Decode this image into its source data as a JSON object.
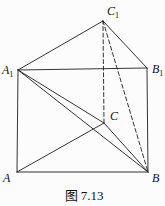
{
  "figure": {
    "caption": "图 7.13",
    "colors": {
      "line": "#1e1e1e",
      "background": "#fcfcfc",
      "text": "#111111"
    },
    "vertices": {
      "A": [
        17,
        172
      ],
      "B": [
        148,
        172
      ],
      "C": [
        104,
        123
      ],
      "A1": [
        18,
        70
      ],
      "B1": [
        147,
        68
      ],
      "C1": [
        103,
        21
      ]
    },
    "edges": [
      {
        "from": "A",
        "to": "B",
        "dashed": false
      },
      {
        "from": "A",
        "to": "A1",
        "dashed": false
      },
      {
        "from": "B",
        "to": "B1",
        "dashed": false
      },
      {
        "from": "A1",
        "to": "B1",
        "dashed": false
      },
      {
        "from": "A1",
        "to": "C1",
        "dashed": false
      },
      {
        "from": "C1",
        "to": "B1",
        "dashed": false
      },
      {
        "from": "A",
        "to": "C",
        "dashed": false
      },
      {
        "from": "C",
        "to": "B",
        "dashed": false
      },
      {
        "from": "A1",
        "to": "C",
        "dashed": false
      },
      {
        "from": "A1",
        "to": "B",
        "dashed": false
      },
      {
        "from": "C",
        "to": "C1",
        "dashed": true
      },
      {
        "from": "C1",
        "to": "B",
        "dashed": true
      }
    ],
    "labels": [
      {
        "text": "A",
        "sub": "1",
        "x": 2,
        "y": 74,
        "name": "A1"
      },
      {
        "text": "B",
        "sub": "1",
        "x": 152,
        "y": 73,
        "name": "B1"
      },
      {
        "text": "C",
        "sub": "1",
        "x": 107,
        "y": 15,
        "name": "C1"
      },
      {
        "text": "C",
        "sub": "",
        "x": 110,
        "y": 120,
        "name": "C"
      },
      {
        "text": "A",
        "sub": "",
        "x": 3,
        "y": 182,
        "name": "A"
      },
      {
        "text": "B",
        "sub": "",
        "x": 152,
        "y": 182,
        "name": "B"
      }
    ],
    "caption_pos": {
      "x": 84,
      "y": 200
    }
  }
}
